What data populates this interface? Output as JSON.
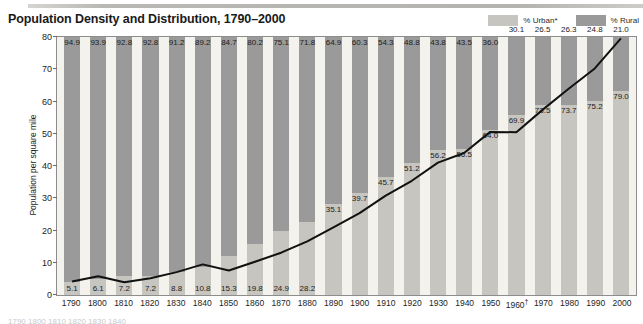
{
  "header": {
    "title": "Population Density and Distribution, 1790–2000"
  },
  "legend": {
    "position": "top-right",
    "items": [
      {
        "label": "% Urban*",
        "color": "#c6c5c0",
        "name": "urban"
      },
      {
        "label": "% Rural",
        "color": "#9a9a9a",
        "name": "rural"
      }
    ]
  },
  "axes": {
    "ylabel": "Population per square mile",
    "yticks": [
      0,
      10,
      20,
      30,
      40,
      50,
      60,
      70,
      80
    ],
    "ylim": [
      0,
      80
    ]
  },
  "colors": {
    "urban": "#c6c5c0",
    "rural": "#9a9a9a",
    "plot_background": "#f4f2ec",
    "line": "#111111",
    "frame": "#8d8d8d"
  },
  "chart_data": {
    "type": "bar",
    "title": "Population Density and Distribution, 1790–2000",
    "xlabel": "",
    "ylabel": "Population per square mile",
    "ylim": [
      0,
      80
    ],
    "grid": false,
    "legend_position": "top-right",
    "categories": [
      "1790",
      "1800",
      "1810",
      "1820",
      "1830",
      "1840",
      "1850",
      "1860",
      "1870",
      "1880",
      "1890",
      "1900",
      "1910",
      "1920",
      "1930",
      "1940",
      "1950",
      "1960†",
      "1970",
      "1980",
      "1990",
      "2000"
    ],
    "series": [
      {
        "name": "% Urban*",
        "stacked": true,
        "values": [
          5.1,
          6.1,
          7.2,
          7.2,
          8.8,
          10.8,
          15.3,
          19.8,
          24.9,
          28.2,
          35.1,
          39.7,
          45.7,
          51.2,
          56.2,
          56.5,
          64.0,
          69.9,
          73.5,
          73.7,
          75.2,
          79.0
        ]
      },
      {
        "name": "% Rural",
        "stacked": true,
        "values": [
          94.9,
          93.9,
          92.8,
          92.8,
          91.2,
          89.2,
          84.7,
          80.2,
          75.1,
          71.8,
          64.9,
          60.3,
          54.3,
          48.8,
          43.8,
          43.5,
          36.0,
          30.1,
          26.5,
          26.3,
          24.8,
          21.0
        ]
      },
      {
        "name": "Population per square mile",
        "type": "line",
        "values": [
          4.5,
          6.1,
          4.3,
          5.5,
          7.4,
          9.8,
          7.9,
          10.6,
          13.4,
          16.9,
          21.2,
          25.6,
          31.0,
          35.6,
          41.2,
          44.2,
          50.7,
          50.6,
          57.5,
          64.0,
          70.3,
          79.6
        ]
      }
    ]
  },
  "footnote_clip": "1790  1800  1810  1820  1830  1840"
}
